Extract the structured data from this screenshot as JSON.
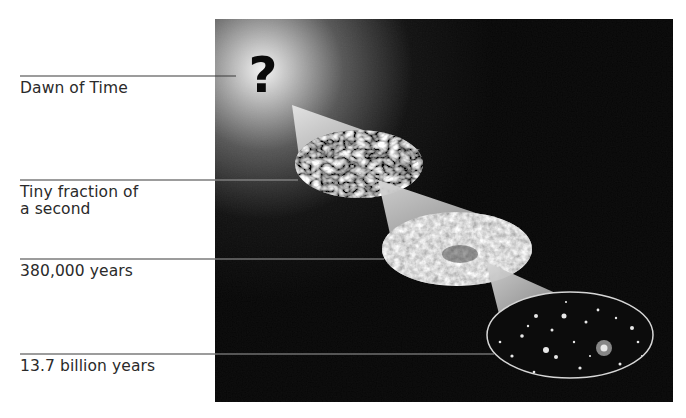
{
  "diagram": {
    "stages": [
      {
        "id": "dawn",
        "label": "Dawn of Time",
        "icon": "question-mark-icon",
        "line_y": 76,
        "line_end_x": 236,
        "label_y": 81
      },
      {
        "id": "tiny",
        "label": "Tiny fraction of\na second",
        "icon": "turbulent-field-ellipse",
        "line_y": 180,
        "line_end_x": 298,
        "label_y": 185
      },
      {
        "id": "cmb",
        "label": "380,000 years",
        "icon": "microwave-background-ellipse",
        "line_y": 259,
        "line_end_x": 384,
        "label_y": 263
      },
      {
        "id": "now",
        "label": "13.7 billion years",
        "icon": "galaxy-field-ellipse",
        "line_y": 354,
        "line_end_x": 494,
        "label_y": 359
      }
    ],
    "question_mark": "?",
    "colors": {
      "panel": "#050505",
      "glow": "#e8e8e8",
      "cone": "#cfcfcf",
      "leader_line": "#3a3a3a",
      "leader_line_on_panel": "#9a9a9a",
      "text": "#2a2a2a"
    }
  }
}
